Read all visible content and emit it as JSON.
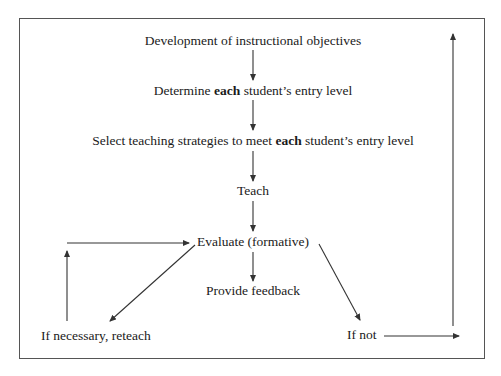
{
  "diagram": {
    "type": "flowchart",
    "nodes": {
      "objectives": {
        "text": "Development of instructional objectives"
      },
      "entry_level": {
        "pre": "Determine ",
        "emph": "each",
        "post": " student’s entry level"
      },
      "strategies": {
        "pre": "Select teaching strategies to meet ",
        "emph": "each",
        "post": " student’s entry level"
      },
      "teach": {
        "text": "Teach"
      },
      "evaluate": {
        "text": "Evaluate (formative)"
      },
      "feedback": {
        "text": "Provide feedback"
      },
      "reteach": {
        "text": "If necessary, reteach"
      },
      "if_not": {
        "text": "If not"
      }
    },
    "edges": [
      {
        "from": "objectives",
        "to": "entry_level"
      },
      {
        "from": "entry_level",
        "to": "strategies"
      },
      {
        "from": "strategies",
        "to": "teach"
      },
      {
        "from": "teach",
        "to": "evaluate"
      },
      {
        "from": "evaluate",
        "to": "feedback"
      },
      {
        "from": "evaluate",
        "to": "reteach"
      },
      {
        "from": "reteach",
        "to": "evaluate"
      },
      {
        "from": "evaluate",
        "to": "if_not"
      },
      {
        "from": "if_not",
        "to": "objectives"
      }
    ],
    "colors": {
      "line": "#333333",
      "border": "#555555",
      "text": "#1a1a1a"
    }
  }
}
